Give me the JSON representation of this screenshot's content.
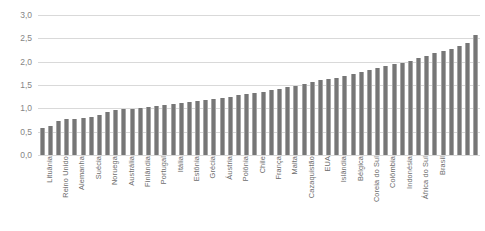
{
  "chart_data": {
    "type": "bar",
    "title": "",
    "xlabel": "",
    "ylabel": "",
    "ylim": [
      0,
      3.0
    ],
    "ytick_labels": [
      "0,0",
      "0,5",
      "1,0",
      "1,5",
      "2,0",
      "2,5",
      "3,0"
    ],
    "ytick_values": [
      0.0,
      0.5,
      1.0,
      1.5,
      2.0,
      2.5,
      3.0
    ],
    "grid": true,
    "legend": "none",
    "decimal_separator": ",",
    "bar_color": "#767676",
    "gridline_color": "#d9d9d9",
    "label_color": "#6d6d6d",
    "labels_every_n_bars": 2,
    "categories": [
      "Lituânia",
      "",
      "Reino Unido",
      "",
      "Alemanha",
      "",
      "Suécia",
      "",
      "Noruega",
      "",
      "Austrália",
      "",
      "Finlândia",
      "",
      "Portugal",
      "",
      "Itália",
      "",
      "Estônia",
      "",
      "Grécia",
      "",
      "Áustria",
      "",
      "Polônia",
      "",
      "Chile",
      "",
      "França",
      "",
      "Malta",
      "",
      "Cazaquistão",
      "",
      "EUA",
      "",
      "Islândia",
      "",
      "Bélgica",
      "",
      "Coreia do Sul",
      "",
      "Colômbia",
      "",
      "Indonésia",
      "",
      "África do Sul",
      "",
      "Brasil",
      "",
      "",
      "",
      "",
      ""
    ],
    "named_categories": [
      "Lituânia",
      "Reino Unido",
      "Alemanha",
      "Suécia",
      "Noruega",
      "Austrália",
      "Finlândia",
      "Portugal",
      "Itália",
      "Estônia",
      "Grécia",
      "Áustria",
      "Polônia",
      "Chile",
      "França",
      "Malta",
      "Cazaquistão",
      "EUA",
      "Islândia",
      "Bélgica",
      "Coreia do Sul",
      "Colômbia",
      "Indonésia",
      "África do Sul",
      "Brasil"
    ],
    "values": [
      0.57,
      0.63,
      0.73,
      0.77,
      0.78,
      0.79,
      0.81,
      0.86,
      0.92,
      0.96,
      0.98,
      0.99,
      1.0,
      1.02,
      1.05,
      1.08,
      1.1,
      1.12,
      1.14,
      1.16,
      1.18,
      1.2,
      1.22,
      1.25,
      1.28,
      1.3,
      1.33,
      1.36,
      1.39,
      1.42,
      1.45,
      1.48,
      1.52,
      1.56,
      1.6,
      1.63,
      1.66,
      1.7,
      1.74,
      1.78,
      1.82,
      1.86,
      1.9,
      1.94,
      1.98,
      2.02,
      2.08,
      2.12,
      2.18,
      2.22,
      2.28,
      2.33,
      2.4,
      2.58
    ]
  }
}
